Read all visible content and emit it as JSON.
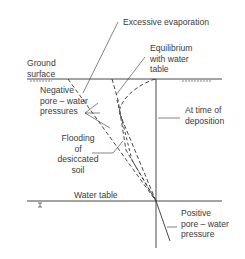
{
  "labels": {
    "excessive_evaporation": "Excessive evaporation",
    "equilibrium": "Equilibrium\nwith water\ntable",
    "ground_surface": "Ground\nsurface",
    "negative_pore": "Negative\npore – water\npressures",
    "at_time_of_deposition": "At time of\ndeposition",
    "flooding": "Flooding\nof\ndesiccated\nsoil",
    "water_table": "Water table",
    "positive_pore": "Positive\npore – water\npressure"
  },
  "colors": {
    "line": "#333333",
    "text": "#3a3a3a"
  }
}
